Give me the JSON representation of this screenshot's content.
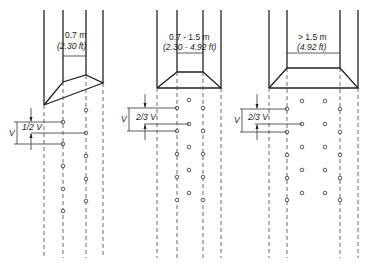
{
  "diagram": {
    "type": "ventilation-slot-spacing",
    "panels": [
      {
        "id": "narrow",
        "width_label": "0.7 m",
        "width_label_imperial": "(2.30 ft)",
        "spacing_label": "1/2 V",
        "vertical_label": "V",
        "stagger": "two rows staggered by half spacing"
      },
      {
        "id": "medium",
        "width_label": "0.7 - 1.5 m",
        "width_label_imperial": "(2.30 - 4.92 ft)",
        "spacing_label": "2/3 V",
        "vertical_label": "V",
        "stagger": "three rows with centre row offset"
      },
      {
        "id": "wide",
        "width_label": "> 1.5 m",
        "width_label_imperial": "(4.92 ft)",
        "spacing_label": "2/3 V",
        "vertical_label": "V",
        "stagger": "four rows, inner rows offset"
      }
    ]
  }
}
